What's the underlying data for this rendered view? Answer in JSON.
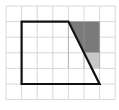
{
  "diagram": {
    "type": "grid-geometry",
    "grid": {
      "columns": 7,
      "rows": 6,
      "origin_x": 6,
      "origin_y": 6,
      "cell": 15.6,
      "line_color": "#d8d8d8"
    },
    "shape": {
      "name": "trapezoid",
      "vertices_grid": [
        [
          1,
          1
        ],
        [
          4,
          1
        ],
        [
          6,
          5
        ],
        [
          1,
          5
        ]
      ],
      "stroke": "#111111"
    },
    "shaded_regions": [
      {
        "name": "dark-shade",
        "vertices_grid": [
          [
            4,
            1
          ],
          [
            6,
            1
          ],
          [
            6,
            3
          ],
          [
            5,
            3
          ]
        ],
        "fill": "#7a7a7a"
      },
      {
        "name": "light-shade",
        "vertices_grid": [
          [
            5,
            3
          ],
          [
            6,
            3
          ],
          [
            6,
            4
          ],
          [
            5.5,
            4
          ]
        ],
        "fill": "#c8c8c8"
      }
    ]
  }
}
